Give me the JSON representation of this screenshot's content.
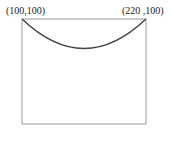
{
  "diagram": {
    "labels": {
      "top_left": "(100,100)",
      "top_right": "(220 ,100)"
    },
    "shape": "rectangle with downward arc along top edge",
    "colors": {
      "stroke": "#8a8a8a",
      "arc": "#444444"
    }
  }
}
